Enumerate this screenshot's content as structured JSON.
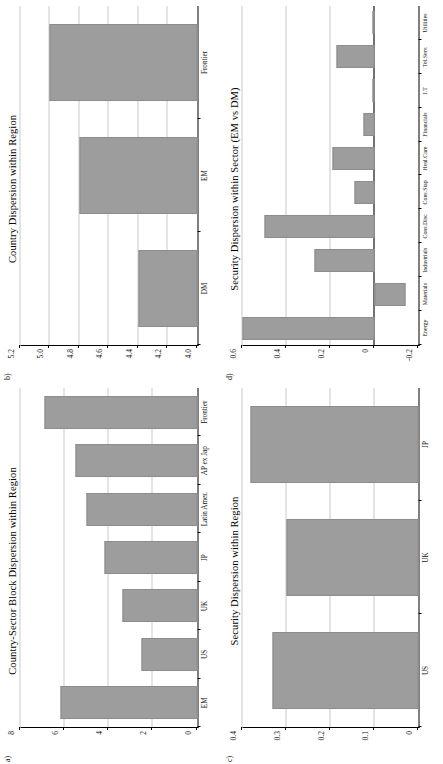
{
  "figure": {
    "orientation": "rotated-90-ccw",
    "background_color": "#ffffff",
    "bar_color": "#9d9d9d",
    "axis_color": "#000000",
    "gridline_color": "#c9c9c9"
  },
  "panels": [
    {
      "letter": "a)",
      "title": "Country-Sector Block Dispersion within Region",
      "name": "country-sector-block-dispersion"
    },
    {
      "letter": "b)",
      "title": "Country Dispersion within Region",
      "name": "country-dispersion"
    },
    {
      "letter": "c)",
      "title": "Security Dispersion within Region",
      "name": "security-dispersion-region"
    },
    {
      "letter": "d)",
      "title": "Security Dispersion within Sector (EM vs DM)",
      "name": "security-dispersion-sector"
    }
  ],
  "chart_data": [
    {
      "type": "bar",
      "title": "Country-Sector Block Dispersion within Region",
      "xlabel": "",
      "ylabel": "",
      "categories": [
        "EM",
        "US",
        "UK",
        "JP",
        "Latin Amer.",
        "AP ex Jap",
        "Frontier"
      ],
      "values": [
        6.2,
        2.5,
        3.4,
        4.2,
        5.0,
        5.5,
        6.9
      ],
      "ylim": [
        0,
        8
      ],
      "yticks": [
        0,
        2,
        4,
        6,
        8
      ],
      "ytick_labels": [
        "0",
        "2",
        "4",
        "6",
        "8"
      ],
      "grid": true,
      "legend": "none"
    },
    {
      "type": "bar",
      "title": "Country Dispersion within Region",
      "xlabel": "",
      "ylabel": "",
      "categories": [
        "DM",
        "EM",
        "Frontier"
      ],
      "values": [
        4.4,
        4.8,
        5.0
      ],
      "ylim": [
        4.0,
        5.2
      ],
      "yticks": [
        4.0,
        4.2,
        4.4,
        4.6,
        4.8,
        5.0,
        5.2
      ],
      "ytick_labels": [
        "4.0",
        "4.2",
        "4.4",
        "4.6",
        "4.8",
        "5.0",
        "5.2"
      ],
      "grid": true,
      "legend": "none"
    },
    {
      "type": "bar",
      "title": "Security Dispersion within Region",
      "xlabel": "",
      "ylabel": "",
      "categories": [
        "US",
        "UK",
        "JP"
      ],
      "values": [
        0.33,
        0.3,
        0.38
      ],
      "ylim": [
        0,
        0.4
      ],
      "yticks": [
        0,
        0.1,
        0.2,
        0.3,
        0.4
      ],
      "ytick_labels": [
        "0",
        "0.1",
        "0.2",
        "0.3",
        "0.4"
      ],
      "grid": true,
      "legend": "none"
    },
    {
      "type": "bar",
      "title": "Security Dispersion within Sector (EM vs DM)",
      "xlabel": "",
      "ylabel": "",
      "categories": [
        "Energy",
        "Materials",
        "Industrials",
        "Cons.Disc",
        "Cons.Stap",
        "Heal.Care",
        "Financials",
        "I.T",
        "Tel.Serv.",
        "Utilities"
      ],
      "values": [
        0.6,
        -0.14,
        0.27,
        0.5,
        0.09,
        0.19,
        0.05,
        0.005,
        0.17,
        0.01
      ],
      "ylim": [
        -0.2,
        0.6
      ],
      "yticks": [
        -0.2,
        0,
        0.2,
        0.4,
        0.6
      ],
      "ytick_labels": [
        "-0.2",
        "0",
        "0.2",
        "0.4",
        "0.6"
      ],
      "grid": true,
      "legend": "none"
    }
  ]
}
